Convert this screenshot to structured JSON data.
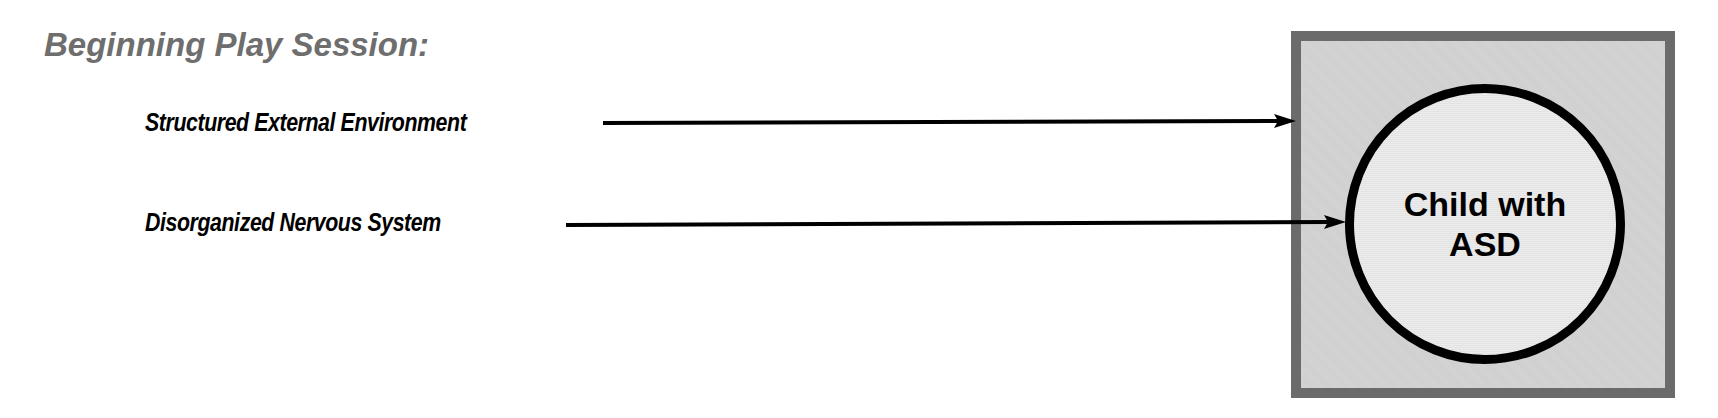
{
  "title": "Beginning Play Session:",
  "inputs": [
    {
      "label": "Structured External Environment",
      "target": "box"
    },
    {
      "label": "Disorganized Nervous System",
      "target": "circle"
    }
  ],
  "center": {
    "line1": "Child with",
    "line2": "ASD"
  },
  "colors": {
    "title": "#6e6e6e",
    "box_border": "#6b6b6b",
    "box_fill": "#d2d2d2",
    "circle_fill": "#e8e8e8",
    "stroke": "#000000"
  }
}
